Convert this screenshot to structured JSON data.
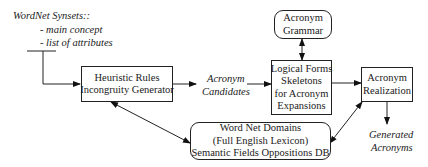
{
  "input": {
    "title": "WordNet Synsets::",
    "items": [
      "- main concept",
      "- list of attributes"
    ]
  },
  "nodes": {
    "heuristic": {
      "lines": [
        "Heuristic Rules",
        "Incongruity Generator"
      ]
    },
    "candidates": {
      "lines": [
        "Acronym",
        "Candidates"
      ]
    },
    "logical_forms": {
      "lines": [
        "Logical Forms",
        "Skeletons",
        "for Acronym",
        "Expansions"
      ]
    },
    "grammar": {
      "lines": [
        "Acronym",
        "Grammar"
      ]
    },
    "realization": {
      "lines": [
        "Acronym",
        "Realization"
      ]
    },
    "wordnet": {
      "lines": [
        "Word Net Domains",
        "(Full English Lexicon)",
        "Semantic Fields Oppositions DB"
      ]
    },
    "output": {
      "lines": [
        "Generated",
        "Acronyms"
      ]
    }
  },
  "edges": [
    {
      "from": "input",
      "to": "heuristic",
      "type": "arrow"
    },
    {
      "from": "heuristic",
      "to": "candidates",
      "type": "arrow"
    },
    {
      "from": "candidates",
      "to": "logical_forms",
      "type": "arrow"
    },
    {
      "from": "grammar",
      "to": "logical_forms",
      "type": "bidirectional"
    },
    {
      "from": "logical_forms",
      "to": "realization",
      "type": "arrow"
    },
    {
      "from": "realization",
      "to": "output",
      "type": "arrow"
    },
    {
      "from": "heuristic",
      "to": "wordnet",
      "type": "bidirectional"
    },
    {
      "from": "wordnet",
      "to": "realization",
      "type": "bidirectional"
    }
  ]
}
